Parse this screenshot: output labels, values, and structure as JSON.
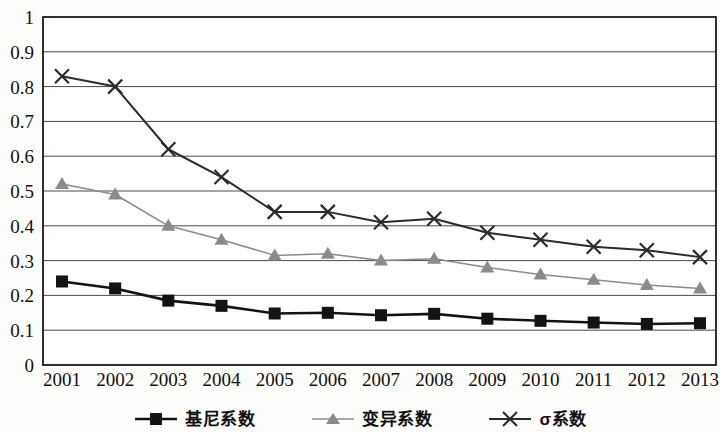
{
  "chart_data": {
    "type": "line",
    "title": "",
    "xlabel": "",
    "ylabel": "",
    "grid": "horizontal",
    "legend_position": "bottom",
    "ylim": [
      0,
      1
    ],
    "ytick_labels": [
      "1",
      "0.9",
      "0.8",
      "0.7",
      "0.6",
      "0.5",
      "0.4",
      "0.3",
      "0.2",
      "0.1",
      "0"
    ],
    "ytick_values": [
      1,
      0.9,
      0.8,
      0.7,
      0.6,
      0.5,
      0.4,
      0.3,
      0.2,
      0.1,
      0
    ],
    "categories": [
      "2001",
      "2002",
      "2003",
      "2004",
      "2005",
      "2006",
      "2007",
      "2008",
      "2009",
      "2010",
      "2011",
      "2012",
      "2013"
    ],
    "series": [
      {
        "name": "基尼系数",
        "marker": "square",
        "color": "#131313",
        "line_width": 2.6,
        "values": [
          0.24,
          0.22,
          0.185,
          0.17,
          0.148,
          0.15,
          0.143,
          0.147,
          0.133,
          0.127,
          0.122,
          0.118,
          0.12
        ]
      },
      {
        "name": "变异系数",
        "marker": "triangle",
        "color": "#8b8b8b",
        "line_width": 1.5,
        "values": [
          0.52,
          0.49,
          0.4,
          0.36,
          0.315,
          0.32,
          0.3,
          0.305,
          0.28,
          0.26,
          0.245,
          0.23,
          0.22
        ]
      },
      {
        "name": "σ系数",
        "marker": "cross",
        "color": "#2b2b2b",
        "line_width": 2.0,
        "values": [
          0.83,
          0.8,
          0.62,
          0.54,
          0.44,
          0.44,
          0.41,
          0.42,
          0.38,
          0.36,
          0.34,
          0.33,
          0.31
        ]
      }
    ]
  },
  "legend": {
    "items": [
      {
        "label": "基尼系数",
        "marker": "square",
        "color": "#131313"
      },
      {
        "label": "变异系数",
        "marker": "triangle",
        "color": "#8b8b8b"
      },
      {
        "label": "σ系数",
        "marker": "cross",
        "color": "#2b2b2b"
      }
    ]
  },
  "plot_frame": {
    "border_color": "#1a1a1a",
    "grid_color": "#4a4a4a",
    "background": "#ffffff"
  }
}
